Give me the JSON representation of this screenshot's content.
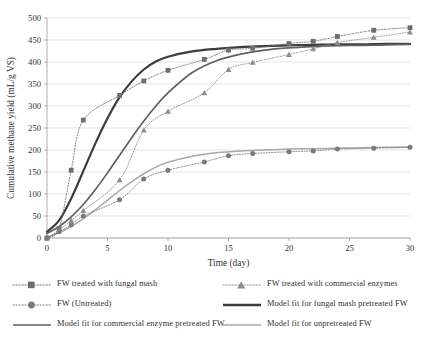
{
  "chart_data": {
    "type": "line",
    "title": "",
    "xlabel": "Time (day)",
    "ylabel": "Cumulative methane yield (mL/g VS)",
    "xlim": [
      0,
      30
    ],
    "ylim": [
      0,
      500
    ],
    "xticks": [
      0,
      5,
      10,
      15,
      20,
      25,
      30
    ],
    "yticks": [
      0,
      50,
      100,
      150,
      200,
      250,
      300,
      350,
      400,
      450,
      500
    ],
    "grid": "horizontal",
    "legend_position": "below-plot",
    "series": [
      {
        "name": "FW treated with fungal mash",
        "kind": "markers-dotted",
        "marker": "square",
        "color": "#6e6e6e",
        "x": [
          0,
          1,
          2,
          3,
          6,
          8,
          10,
          13,
          15,
          17,
          20,
          22,
          24,
          27,
          30
        ],
        "y": [
          0,
          22,
          154,
          268,
          324,
          357,
          381,
          406,
          427,
          431,
          442,
          447,
          458,
          472,
          478
        ]
      },
      {
        "name": "FW treated with commercial enzymes",
        "kind": "markers-dotted",
        "marker": "triangle",
        "color": "#8c8c8c",
        "x": [
          0,
          1,
          2,
          3,
          6,
          8,
          10,
          13,
          15,
          17,
          20,
          22,
          24,
          27,
          30
        ],
        "y": [
          0,
          18,
          40,
          62,
          132,
          245,
          288,
          330,
          383,
          399,
          417,
          430,
          444,
          456,
          468
        ]
      },
      {
        "name": "FW (Untreated)",
        "kind": "markers-dotted",
        "marker": "circle",
        "color": "#7a7a7a",
        "x": [
          0,
          1,
          2,
          3,
          6,
          8,
          10,
          13,
          15,
          17,
          20,
          22,
          24,
          27,
          30
        ],
        "y": [
          0,
          14,
          30,
          50,
          87,
          134,
          154,
          173,
          187,
          192,
          196,
          198,
          202,
          204,
          206
        ]
      },
      {
        "name": "Model fit for fungal mash pretreated FW",
        "kind": "line",
        "color": "#3c3c3c",
        "width": 2.2,
        "x": [
          0,
          1,
          2,
          3,
          4,
          5,
          6,
          7,
          8,
          9,
          10,
          12,
          14,
          16,
          18,
          20,
          22,
          24,
          26,
          28,
          30
        ],
        "y": [
          14,
          40,
          90,
          152,
          215,
          272,
          320,
          356,
          383,
          401,
          412,
          424,
          430,
          434,
          436,
          438,
          439,
          440,
          440,
          441,
          441
        ]
      },
      {
        "name": "Model fit for commercial enzyme pretreated FW",
        "kind": "line",
        "color": "#606060",
        "width": 1.7,
        "x": [
          0,
          1,
          2,
          3,
          4,
          5,
          6,
          7,
          8,
          9,
          10,
          12,
          14,
          16,
          18,
          20,
          22,
          24,
          26,
          28,
          30
        ],
        "y": [
          10,
          26,
          48,
          76,
          110,
          148,
          188,
          228,
          266,
          300,
          330,
          376,
          403,
          418,
          427,
          432,
          435,
          437,
          438,
          439,
          440
        ]
      },
      {
        "name": "Model fit for unpretreated FW",
        "kind": "line",
        "color": "#a8a8a8",
        "width": 1.5,
        "x": [
          0,
          1,
          2,
          3,
          4,
          5,
          6,
          7,
          8,
          9,
          10,
          12,
          14,
          16,
          18,
          20,
          22,
          24,
          26,
          28,
          30
        ],
        "y": [
          2,
          12,
          26,
          44,
          64,
          86,
          108,
          128,
          146,
          161,
          172,
          186,
          194,
          198,
          200,
          202,
          203,
          204,
          205,
          206,
          207
        ]
      }
    ]
  },
  "axes": {
    "x_title": "Time (day)",
    "y_title": "Cumulative methane yield (mL/g VS)"
  },
  "legend": {
    "items": [
      {
        "label": "FW treated with fungal mash",
        "key": "dotted-square-marker",
        "color": "#6e6e6e"
      },
      {
        "label": "FW treated with commercial enzymes",
        "key": "dotted-triangle-marker",
        "color": "#8c8c8c"
      },
      {
        "label": "FW (Untreated)",
        "key": "dotted-circle-marker",
        "color": "#7a7a7a"
      },
      {
        "label": "Model fit for fungal mash pretreated FW",
        "key": "thick-solid-line",
        "color": "#3c3c3c"
      },
      {
        "label": "Model fit for commercial enzyme pretreated FW",
        "key": "solid-line",
        "color": "#606060"
      },
      {
        "label": "Model fit for unpretreated FW",
        "key": "thin-solid-line",
        "color": "#a8a8a8"
      }
    ]
  },
  "colors": {
    "grid": "#d9d9d9",
    "axis": "#9a9a9a",
    "text": "#2f2f2f"
  }
}
